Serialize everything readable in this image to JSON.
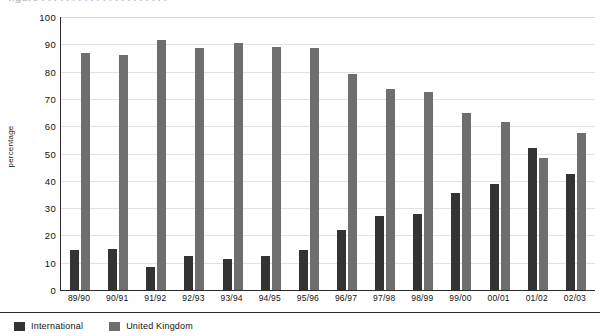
{
  "chart_data": {
    "type": "bar",
    "title": "",
    "xlabel": "",
    "ylabel": "percentage",
    "ylim": [
      0,
      100
    ],
    "ytick_step": 10,
    "grid": true,
    "legend_position": "bottom-left",
    "categories": [
      "89/90",
      "90/91",
      "91/92",
      "92/93",
      "93/94",
      "94/95",
      "95/96",
      "96/97",
      "97/98",
      "98/99",
      "99/00",
      "00/01",
      "01/02",
      "02/03"
    ],
    "yticks": [
      "0",
      "10",
      "20",
      "30",
      "40",
      "50",
      "60",
      "70",
      "80",
      "90",
      "100"
    ],
    "series": [
      {
        "name": "International",
        "color": "#333333",
        "values": [
          14.5,
          15,
          8.5,
          12.5,
          11.5,
          12.5,
          14.5,
          22,
          27,
          28,
          35.5,
          39,
          52,
          42.5
        ]
      },
      {
        "name": "United Kingdom",
        "color": "#6e6e6e",
        "values": [
          87,
          86,
          91.5,
          88.5,
          90.5,
          89,
          88.5,
          79,
          73.5,
          72.5,
          65,
          61.5,
          48.5,
          57.5
        ]
      }
    ]
  },
  "legend": {
    "items": [
      {
        "label": "International",
        "swatch": "intl"
      },
      {
        "label": "United Kingdom",
        "swatch": "uk"
      }
    ]
  },
  "top_strip": {
    "cut_title": "figure . . . . . . . . . . . . . . . . . . . . ."
  },
  "colors": {
    "international": "#333333",
    "united_kingdom": "#6e6e6e",
    "axis": "#2b2b2b",
    "grid": "#e2e2e2",
    "background": "#ffffff"
  }
}
